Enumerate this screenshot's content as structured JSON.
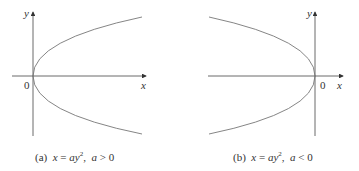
{
  "panels": [
    {
      "id": "a",
      "axis_y_label": "y",
      "axis_x_label": "x",
      "origin_label": "0",
      "caption": {
        "tag": "(a)",
        "equation_lhs": "x",
        "equals": "=",
        "equation_rhs": "ay",
        "exponent": "2",
        "sep": ",",
        "condition_var": "a",
        "condition_op": ">",
        "condition_val": "0"
      },
      "opens": "right"
    },
    {
      "id": "b",
      "axis_y_label": "y",
      "axis_x_label": "x",
      "origin_label": "0",
      "caption": {
        "tag": "(b)",
        "equation_lhs": "x",
        "equals": "=",
        "equation_rhs": "ay",
        "exponent": "2",
        "sep": ",",
        "condition_var": "a",
        "condition_op": "<",
        "condition_val": "0"
      },
      "opens": "left"
    }
  ],
  "colors": {
    "axis": "#444444",
    "curve": "#777777",
    "text": "#333333"
  }
}
